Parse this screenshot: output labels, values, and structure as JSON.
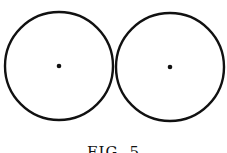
{
  "figure": {
    "caption": "FIG. 5",
    "stroke_color": "#111111",
    "circles": [
      {
        "name": "left-circle",
        "cx": 59,
        "cy": 66,
        "r": 55,
        "center_dot": true
      },
      {
        "name": "right-circle",
        "cx": 170,
        "cy": 67,
        "r": 55,
        "center_dot": true
      }
    ]
  }
}
